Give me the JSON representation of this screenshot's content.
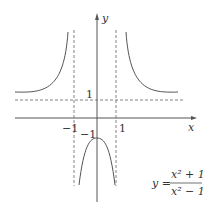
{
  "figure": {
    "axis_labels": {
      "x": "x",
      "y": "y"
    },
    "ticks": {
      "x_neg": "−1",
      "x_pos": "1",
      "y_pos": "1",
      "y_neg": "−1"
    },
    "equation": {
      "lhs": "y =",
      "numerator": "x² + 1",
      "denominator": "x² − 1"
    },
    "asymptotes": {
      "vertical": [
        -1,
        1
      ],
      "horizontal": [
        1
      ]
    },
    "colors": {
      "curve": "#555555",
      "axis": "#555555",
      "dashed": "#666666",
      "text": "#333333"
    }
  }
}
